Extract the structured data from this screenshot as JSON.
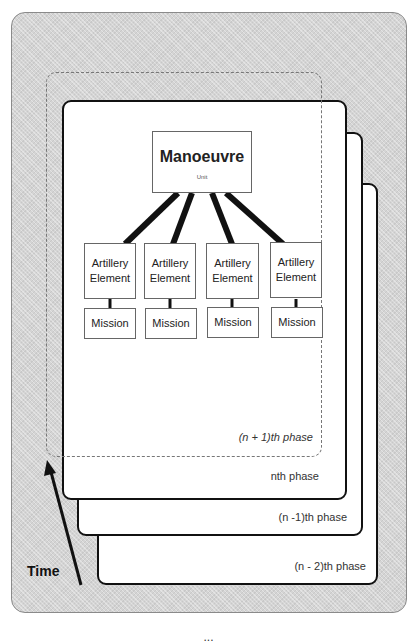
{
  "diagram": {
    "title_node": {
      "label": "Manoeuvre",
      "sublabel": "Unit"
    },
    "elements": [
      {
        "label_line1": "Artillery",
        "label_line2": "Element",
        "child": "Mission"
      },
      {
        "label_line1": "Artillery",
        "label_line2": "Element",
        "child": "Mission"
      },
      {
        "label_line1": "Artillery",
        "label_line2": "Element",
        "child": "Mission"
      },
      {
        "label_line1": "Artillery",
        "label_line2": "Element",
        "child": "Mission"
      }
    ],
    "phases": {
      "future": "(n + 1)th phase",
      "current": "nth phase",
      "previous": "(n -1)th phase",
      "previous2": "(n - 2)th phase"
    },
    "axis_label": "Time",
    "caption": "...",
    "colors": {
      "background_pattern": "#d4d4d4",
      "card_border": "#111111",
      "card_fill": "#ffffff",
      "dashed_border": "#777777"
    }
  }
}
